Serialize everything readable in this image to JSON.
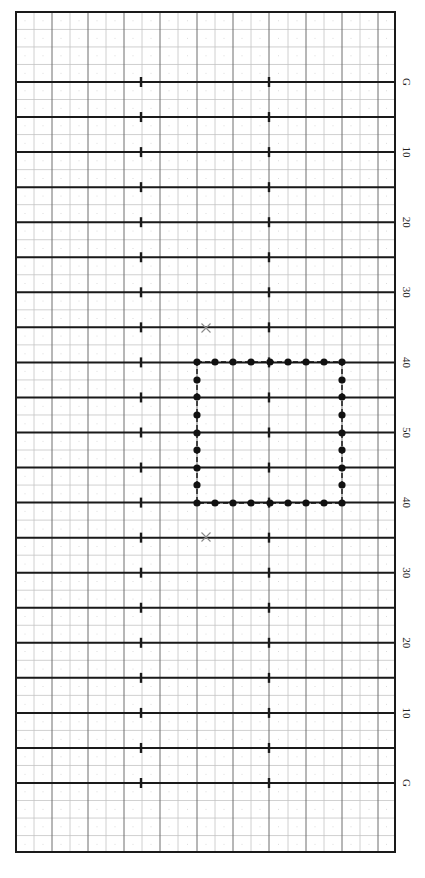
{
  "chart_data": {
    "type": "scatter",
    "title": "",
    "orientation": "field rotated; yard lines horizontal, labels on right side reading top-to-bottom",
    "field": {
      "left": 16,
      "right": 395,
      "top": 12,
      "bottom": 852,
      "first_yard_line_y": 82,
      "yard_line_spacing": 35.05,
      "yard_line_count": 21,
      "minor_h_spacing": 17.525,
      "v_lines_x": [
        16,
        34,
        52,
        70,
        88,
        106,
        124,
        142,
        160,
        178,
        197,
        215,
        233,
        251,
        269,
        288,
        306,
        324,
        342,
        360,
        378,
        395
      ],
      "hash_x": [
        141,
        269
      ]
    },
    "yard_labels": [
      {
        "text": "G",
        "line_index": 0
      },
      {
        "text": "10",
        "line_index": 2
      },
      {
        "text": "20",
        "line_index": 4
      },
      {
        "text": "30",
        "line_index": 6
      },
      {
        "text": "40",
        "line_index": 8
      },
      {
        "text": "50",
        "line_index": 10
      },
      {
        "text": "40",
        "line_index": 12
      },
      {
        "text": "30",
        "line_index": 14
      },
      {
        "text": "20",
        "line_index": 16
      },
      {
        "text": "10",
        "line_index": 18
      },
      {
        "text": "G",
        "line_index": 20
      }
    ],
    "formation": {
      "shape": "rectangle",
      "x_left": 197,
      "x_right": 342,
      "y_top": 362,
      "y_bottom": 503,
      "top_row_x": [
        197,
        215,
        233,
        251,
        270,
        288,
        306,
        324,
        342
      ],
      "side_col_y": [
        362,
        380,
        397,
        415,
        433,
        450,
        468,
        485,
        503
      ],
      "dot_radius": 3.6,
      "connector": "dashed"
    },
    "markers": [
      {
        "type": "x",
        "x": 206,
        "y": 328
      },
      {
        "type": "x",
        "x": 206,
        "y": 537
      }
    ]
  },
  "colors": {
    "border": "#1a1a1a",
    "yard_line": "#1a1a1a",
    "major_grid": "#6f6f6f",
    "minor_grid": "#c4c4c4",
    "dot": "#111111",
    "marker": "#8a8a8a"
  }
}
